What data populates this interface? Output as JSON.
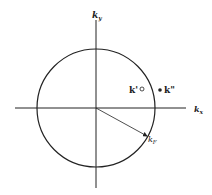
{
  "diagram": {
    "axes": {
      "x_label": "k",
      "x_sub": "x",
      "y_label": "k",
      "y_sub": "y"
    },
    "circle": {
      "cx": 96,
      "cy": 108,
      "r": 59
    },
    "points": [
      {
        "label": "k'",
        "style": "open",
        "x": 142,
        "y": 89
      },
      {
        "label": "k\"",
        "style": "filled",
        "x": 160,
        "y": 90
      }
    ],
    "radius_vector": {
      "label": "k",
      "sub": "F"
    },
    "colors": {
      "line": "#222222",
      "background": "#ffffff"
    }
  }
}
